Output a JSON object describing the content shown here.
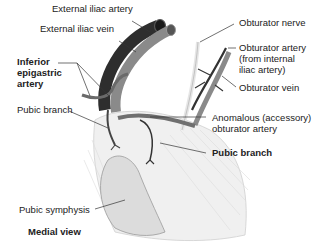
{
  "figure": {
    "view_label": "Medial view",
    "colors": {
      "artery_dark": "#2e2e2e",
      "vein_light": "#8a8a8a",
      "nerve": "#e6e6e6",
      "bone_shade": "#e9e9e9",
      "symphysis": "#dadada",
      "leader": "#333333",
      "text": "#222222"
    },
    "labels": {
      "external_iliac_artery": "External iliac artery",
      "external_iliac_vein": "External iliac vein",
      "inferior_epigastric_artery_line1": "Inferior",
      "inferior_epigastric_artery_line2": "epigastric",
      "inferior_epigastric_artery_line3": "artery",
      "pubic_branch_left": "Pubic branch",
      "obturator_nerve": "Obturator nerve",
      "obturator_artery_line1": "Obturator artery",
      "obturator_artery_line2": "(from internal",
      "obturator_artery_line3": "iliac artery)",
      "obturator_vein": "Obturator vein",
      "anomalous_line1": "Anomalous (accessory)",
      "anomalous_line2": "obturator artery",
      "pubic_branch_right": "Pubic branch",
      "pubic_symphysis": "Pubic symphysis"
    }
  }
}
